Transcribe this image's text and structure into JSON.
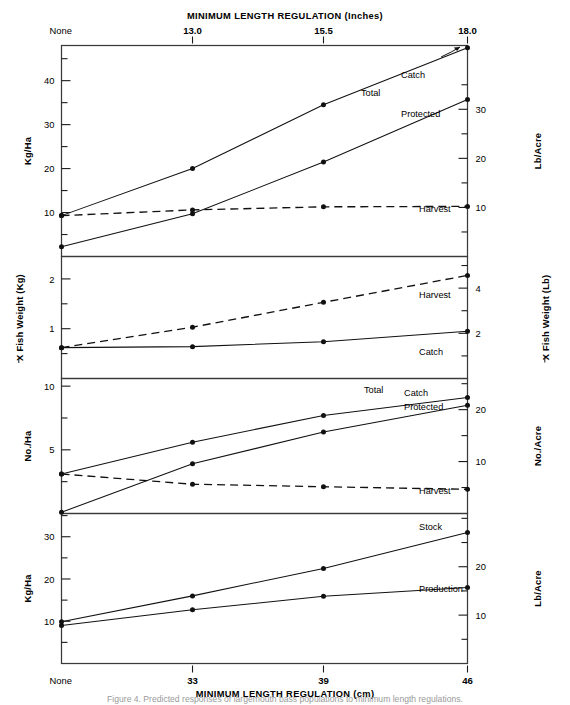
{
  "figure": {
    "top_axis_title": "MINIMUM LENGTH REGULATION (Inches)",
    "bottom_axis_title": "MINIMUM LENGTH REGULATION (cm)",
    "caption": "Figure 4. Predicted responses of largemouth bass populations to minimum length regulations."
  },
  "axes": {
    "top_ticks": [
      "None",
      "13.0",
      "15.5",
      "18.0"
    ],
    "bottom_ticks": [
      "None",
      "33",
      "39",
      "46"
    ]
  },
  "labels": {
    "total": "Total",
    "catch": "Catch",
    "protected": "Protected",
    "harvest": "Harvest",
    "stock": "Stock",
    "production": "Production"
  },
  "chart_data": [
    {
      "type": "line",
      "panel": 1,
      "title": "",
      "xlabel": "MINIMUM LENGTH REGULATION (Inches)",
      "ylabel": "Kg/Ha",
      "ylabel_right": "Lb/Acre",
      "categories": [
        "None",
        "33",
        "39",
        "46"
      ],
      "x_inches": [
        "None",
        "13.0",
        "15.5",
        "18.0"
      ],
      "ylim": [
        0,
        48
      ],
      "yticks": [
        10,
        20,
        30,
        40
      ],
      "yminor": [
        5,
        15,
        25,
        35,
        45
      ],
      "ylim_right": [
        0,
        43
      ],
      "yticks_right": [
        10,
        20,
        30
      ],
      "yminor_right": [
        5,
        15,
        25,
        35
      ],
      "grid": false,
      "series": [
        {
          "name": "Total Catch",
          "style": "solid",
          "values": [
            9.3,
            20.0,
            34.5,
            47.5
          ]
        },
        {
          "name": "Protected",
          "style": "solid",
          "values": [
            2.2,
            9.7,
            21.5,
            35.7
          ]
        },
        {
          "name": "Harvest",
          "style": "dashed",
          "values": [
            9.3,
            10.6,
            11.3,
            11.4
          ]
        }
      ]
    },
    {
      "type": "line",
      "panel": 2,
      "title": "",
      "ylabel": "X Fish Weight (Kg)",
      "ylabel_right": "X Fish Weight (Lb)",
      "categories": [
        "None",
        "33",
        "39",
        "46"
      ],
      "ylim": [
        0,
        2.45
      ],
      "yticks": [
        1,
        2
      ],
      "yminor": [
        0.5,
        1.5
      ],
      "ylim_right": [
        0,
        5.4
      ],
      "yticks_right": [
        2,
        4
      ],
      "yminor_right": [
        1,
        3,
        5
      ],
      "grid": false,
      "series": [
        {
          "name": "Harvest",
          "style": "dashed",
          "values": [
            0.62,
            1.03,
            1.53,
            2.07
          ]
        },
        {
          "name": "Catch",
          "style": "solid",
          "values": [
            0.62,
            0.64,
            0.74,
            0.95
          ]
        }
      ]
    },
    {
      "type": "line",
      "panel": 3,
      "title": "",
      "ylabel": "No./Ha",
      "ylabel_right": "No./Acre",
      "categories": [
        "None",
        "33",
        "39",
        "46"
      ],
      "ylim": [
        0,
        10.6
      ],
      "yticks": [
        5,
        10
      ],
      "yminor": [
        2.5,
        7.5
      ],
      "ylim_right": [
        0,
        26
      ],
      "yticks_right": [
        10,
        20
      ],
      "yminor_right": [
        5,
        15,
        25
      ],
      "grid": false,
      "series": [
        {
          "name": "Total Catch",
          "style": "solid",
          "values": [
            3.1,
            5.6,
            7.7,
            9.1
          ]
        },
        {
          "name": "Protected",
          "style": "solid",
          "values": [
            0.1,
            3.9,
            6.4,
            8.5
          ]
        },
        {
          "name": "Harvest",
          "style": "dashed",
          "values": [
            3.1,
            2.3,
            2.1,
            1.9
          ]
        }
      ]
    },
    {
      "type": "line",
      "panel": 4,
      "title": "",
      "xlabel": "MINIMUM LENGTH REGULATION (cm)",
      "ylabel": "Kg/Ha",
      "ylabel_right": "Lb/Acre",
      "categories": [
        "None",
        "33",
        "39",
        "46"
      ],
      "ylim": [
        0,
        35.5
      ],
      "yticks": [
        10,
        20,
        30
      ],
      "yminor": [
        5,
        15,
        25,
        35
      ],
      "ylim_right": [
        0,
        31
      ],
      "yticks_right": [
        10,
        20
      ],
      "yminor_right": [
        5,
        15,
        25,
        30
      ],
      "grid": false,
      "series": [
        {
          "name": "Stock",
          "style": "solid",
          "values": [
            9.9,
            16.0,
            22.5,
            31.0
          ]
        },
        {
          "name": "Production",
          "style": "solid",
          "values": [
            9.0,
            12.7,
            15.9,
            18.0
          ]
        }
      ]
    }
  ]
}
